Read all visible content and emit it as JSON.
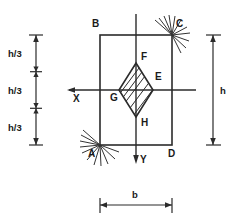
{
  "figure": {
    "type": "engineering-cross-section",
    "line_color": "#2b2b2b",
    "background_color": "#ffffff"
  },
  "labels": {
    "corner_A": "A",
    "corner_B": "B",
    "corner_C": "C",
    "corner_D": "D",
    "point_E": "E",
    "point_F": "F",
    "point_G": "G",
    "point_H": "H",
    "axis_x": "X",
    "axis_y": "Y"
  },
  "dimensions": {
    "left_segment_1": "h/3",
    "left_segment_2": "h/3",
    "left_segment_3": "h/3",
    "right_total": "h",
    "bottom_width": "b"
  },
  "geometry": {
    "rect": {
      "x": 100,
      "y": 35,
      "width": 72,
      "height": 110
    },
    "rhombus": {
      "cx": 136,
      "cy": 90,
      "rx": 17,
      "ry": 27
    },
    "x_axis_y": 90,
    "y_axis_x": 136,
    "hatch_count": 5,
    "support_ray_count": 9
  }
}
